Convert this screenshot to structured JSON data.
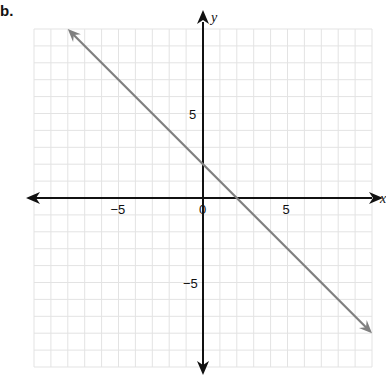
{
  "problem_label": "b.",
  "chart_data": {
    "type": "line",
    "title": "",
    "xlabel": "x",
    "ylabel": "y",
    "xlim": [
      -10,
      10
    ],
    "ylim": [
      -10,
      10
    ],
    "grid": true,
    "x_ticks_labeled": [
      -5,
      0,
      5
    ],
    "y_ticks_labeled": [
      5,
      -5
    ],
    "tick_labels": {
      "x_neg": "−5",
      "origin": "0",
      "x_pos": "5",
      "y_pos": "5",
      "y_neg": "−5"
    },
    "series": [
      {
        "name": "line",
        "equation": "y = -x + 2",
        "slope": -1,
        "intercept": 2,
        "x": [
          -8,
          10
        ],
        "y": [
          10,
          -8
        ],
        "color": "#808080",
        "arrows": "both"
      }
    ],
    "axis_color": "#111111",
    "grid_color": "#e3e3e3"
  }
}
